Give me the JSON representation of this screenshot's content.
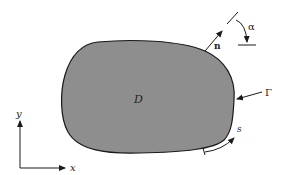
{
  "diagram": {
    "region_label": "D",
    "boundary_label": "Γ",
    "normal_label": "n",
    "angle_label": "α",
    "arc_length_label": "s",
    "axis_x_label": "x",
    "axis_y_label": "y",
    "colors": {
      "region_fill": "#8e8e8e",
      "outline": "#1a1a1a",
      "background": "#ffffff"
    }
  }
}
